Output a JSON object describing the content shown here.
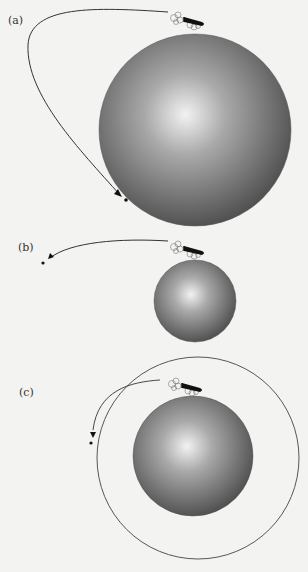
{
  "figure": {
    "panels": [
      {
        "label": "(a)",
        "sphere": {
          "cx": 195,
          "cy": 130,
          "r": 96
        },
        "trajectory": "falls back to surface"
      },
      {
        "label": "(b)",
        "sphere": {
          "cx": 195,
          "cy": 301,
          "r": 41
        },
        "trajectory": "escapes trajectory"
      },
      {
        "label": "(c)",
        "sphere": {
          "cx": 193,
          "cy": 456,
          "r": 60
        },
        "trajectory": "circular orbit"
      }
    ],
    "colors": {
      "background": "#f3f3f1",
      "sphere_light": "#f2f2f2",
      "sphere_dark": "#4e4e4e",
      "line": "#333333",
      "cannon": "#111111"
    }
  }
}
